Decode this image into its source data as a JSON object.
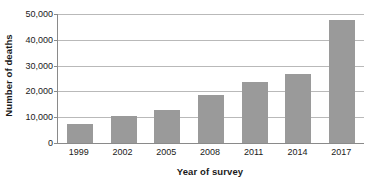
{
  "chart_data": {
    "type": "bar",
    "title": "",
    "subtitle": "",
    "xlabel": "Year of survey",
    "ylabel": "Number of deaths",
    "categories": [
      "1999",
      "2002",
      "2005",
      "2008",
      "2011",
      "2014",
      "2017"
    ],
    "values": [
      7500,
      10500,
      12800,
      18600,
      23600,
      26700,
      47600
    ],
    "series": [
      {
        "name": "Number of deaths",
        "values": [
          7500,
          10500,
          12800,
          18600,
          23600,
          26700,
          47600
        ]
      }
    ],
    "ylim": [
      0,
      50000
    ],
    "ytick_values": [
      0,
      10000,
      20000,
      30000,
      40000,
      50000
    ],
    "ytick_labels": [
      "0",
      "10,000",
      "20,000",
      "30,000",
      "40,000",
      "50,000"
    ],
    "grid": true,
    "grid_axis": "y",
    "legend": false,
    "legend_position": "none",
    "bar_color": "#9a9a9a",
    "gridline_color": "#b9b9b9",
    "axis_color": "#8a8a8a",
    "background_color": "#ffffff",
    "text_color": "#1a1a1a",
    "annotations": []
  }
}
